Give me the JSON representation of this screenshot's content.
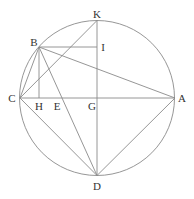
{
  "diagram": {
    "type": "geometry-circle-construction",
    "circle": {
      "center": "G",
      "cx": 97,
      "cy": 98,
      "r": 77.5
    },
    "points": {
      "K": {
        "x": 97,
        "y": 20.5,
        "label": "K",
        "lx": 97,
        "ly": 18
      },
      "B": {
        "x": 39,
        "y": 47,
        "label": "B",
        "lx": 34,
        "ly": 46
      },
      "I": {
        "x": 97,
        "y": 47,
        "label": "I",
        "lx": 103,
        "ly": 51
      },
      "C": {
        "x": 20,
        "y": 98,
        "label": "C",
        "lx": 12,
        "ly": 102
      },
      "H": {
        "x": 39,
        "y": 98,
        "label": "H",
        "lx": 39,
        "ly": 110
      },
      "E": {
        "x": 60,
        "y": 98,
        "label": "E",
        "lx": 57,
        "ly": 110
      },
      "G": {
        "x": 97,
        "y": 98,
        "label": "G",
        "lx": 92,
        "ly": 110
      },
      "A": {
        "x": 175,
        "y": 98,
        "label": "A",
        "lx": 182,
        "ly": 102
      },
      "D": {
        "x": 97,
        "y": 175.5,
        "label": "D",
        "lx": 97,
        "ly": 190
      }
    },
    "segments": [
      [
        "C",
        "A"
      ],
      [
        "K",
        "D"
      ],
      [
        "B",
        "I"
      ],
      [
        "B",
        "H"
      ],
      [
        "C",
        "K"
      ],
      [
        "C",
        "B"
      ],
      [
        "B",
        "A"
      ],
      [
        "B",
        "D"
      ],
      [
        "C",
        "D"
      ],
      [
        "D",
        "A"
      ]
    ]
  }
}
